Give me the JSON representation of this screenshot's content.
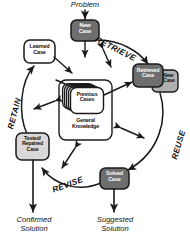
{
  "diagram": {
    "colors": {
      "dark_node": "#6e6e6e",
      "dark_node_text": "#ffffff",
      "light_node": "#d9d9d9",
      "shadow_node": "#b0b0b0",
      "white_node": "#ffffff",
      "outline": "#1a1a1a",
      "text": "#111111"
    },
    "nodes": [
      {
        "id": "new-case-top",
        "label": "New\nCase",
        "line1": "New",
        "line2": "Case",
        "line3": "",
        "fill": "dark"
      },
      {
        "id": "retrieved-case",
        "label": "Retrieved\nCase",
        "line1": "Retrieved",
        "line2": "Case",
        "line3": "",
        "fill": "dark"
      },
      {
        "id": "new-case-shadow",
        "label": "New\nCase",
        "line1": "New",
        "line2": "Case",
        "line3": "",
        "fill": "shadow"
      },
      {
        "id": "solved-case",
        "label": "Solved\nCase",
        "line1": "Solved",
        "line2": "Case",
        "line3": "",
        "fill": "dark"
      },
      {
        "id": "tested-case",
        "label": "Tested/\nRepaired\nCase",
        "line1": "Tested/",
        "line2": "Repaired",
        "line3": "Case",
        "fill": "light"
      },
      {
        "id": "learned-case",
        "label": "Learned\nCase",
        "line1": "Learned",
        "line2": "Case",
        "line3": "",
        "fill": "white"
      },
      {
        "id": "previous-cases",
        "label": "Previous\nCases",
        "line1": "Previous",
        "line2": "Cases",
        "line3": "",
        "fill": "white"
      },
      {
        "id": "general-knowledge",
        "label": "General\nKnowledge",
        "line1": "General",
        "line2": "Knowledge",
        "line3": "",
        "fill": "white"
      }
    ],
    "phases": [
      {
        "id": "retrieve",
        "label": "RETRIEVE"
      },
      {
        "id": "reuse",
        "label": "REUSE"
      },
      {
        "id": "revise",
        "label": "REVISE"
      },
      {
        "id": "retain",
        "label": "RETAIN"
      }
    ],
    "io": [
      {
        "id": "problem",
        "line1": "Problem",
        "line2": ""
      },
      {
        "id": "suggested-solution",
        "line1": "Suggested",
        "line2": "Solution"
      },
      {
        "id": "confirmed-solution",
        "line1": "Confirmed",
        "line2": "Solution"
      }
    ]
  }
}
